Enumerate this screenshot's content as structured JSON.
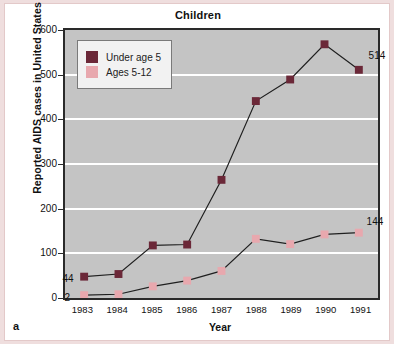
{
  "figure": {
    "panel_letter": "a",
    "title": "Children"
  },
  "chart_data": {
    "type": "line",
    "title": "Children",
    "xlabel": "Year",
    "ylabel": "Reported AIDS cases in United States",
    "categories": [
      "1983",
      "1984",
      "1985",
      "1986",
      "1987",
      "1988",
      "1989",
      "1990",
      "1991"
    ],
    "ylim": [
      0,
      600
    ],
    "yticks": [
      0,
      100,
      200,
      300,
      400,
      500,
      600
    ],
    "grid": true,
    "legend_position": "top-left",
    "series": [
      {
        "name": "Under age 5",
        "color": "#6b2838",
        "values": [
          44,
          50,
          115,
          117,
          264,
          443,
          492,
          572,
          514
        ]
      },
      {
        "name": "Ages 5-12",
        "color": "#e8a8ae",
        "values": [
          2,
          4,
          22,
          35,
          57,
          130,
          118,
          140,
          144
        ]
      }
    ],
    "annotations": [
      {
        "label": "44",
        "series": "Under age 5",
        "category": "1983",
        "value": 44
      },
      {
        "label": "2",
        "series": "Ages 5-12",
        "category": "1983",
        "value": 2
      },
      {
        "label": "514",
        "series": "Under age 5",
        "category": "1991",
        "value": 514
      },
      {
        "label": "144",
        "series": "Ages 5-12",
        "category": "1991",
        "value": 144
      }
    ]
  }
}
